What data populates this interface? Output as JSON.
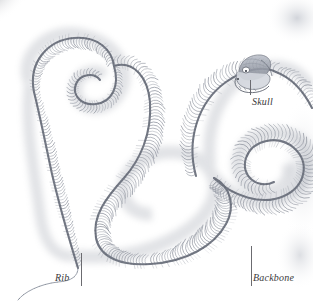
{
  "figure": {
    "style": "engraving",
    "background_color": "#ffffff",
    "ink_color": "#8e929c",
    "label_color": "#3a3a3c",
    "leader_color": "#6b6b70",
    "width": 313,
    "height": 304
  },
  "labels": [
    {
      "id": "skull",
      "text": "Skull",
      "x": 252,
      "y": 96,
      "leader": {
        "x": 250,
        "y1": 80,
        "y2": 95
      }
    },
    {
      "id": "rib",
      "text": "Rib",
      "x": 55,
      "y": 272,
      "leader": {
        "x": 81,
        "y1": 253,
        "y2": 286
      }
    },
    {
      "id": "backbone",
      "text": "Backbone",
      "x": 253,
      "y": 272,
      "leader": {
        "x": 251,
        "y1": 246,
        "y2": 286
      }
    }
  ],
  "anatomy": {
    "parts": [
      "Skull",
      "Rib",
      "Backbone"
    ],
    "vertebra_count_visible": 220
  }
}
